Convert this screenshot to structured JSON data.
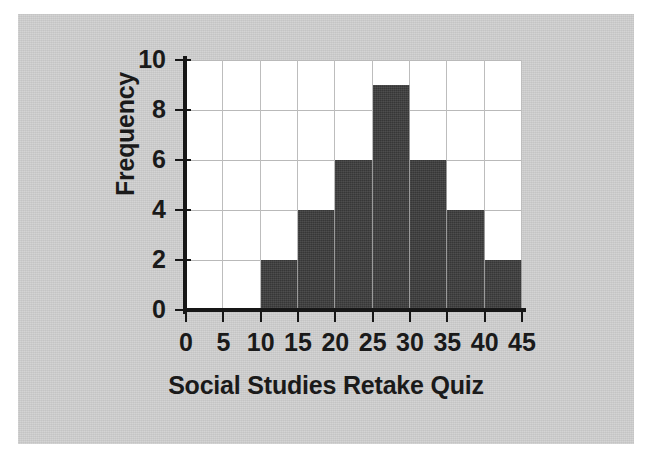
{
  "figure": {
    "background_color": "#cfcfcf",
    "plot_background_color": "#ffffff",
    "bar_color": "#3d3d3d",
    "grid_color": "#b9b9b9",
    "axis_color": "#171717"
  },
  "chart_data": {
    "type": "bar",
    "title": "",
    "xlabel": "Social Studies Retake Quiz",
    "ylabel": "Frequency",
    "categories": [
      "0-5",
      "5-10",
      "10-15",
      "15-20",
      "20-25",
      "25-30",
      "30-35",
      "35-40",
      "40-45"
    ],
    "bin_edges": [
      0,
      5,
      10,
      15,
      20,
      25,
      30,
      35,
      40,
      45
    ],
    "values": [
      0,
      0,
      2,
      4,
      6,
      9,
      6,
      4,
      2
    ],
    "xlim": [
      0,
      45
    ],
    "ylim": [
      0,
      10
    ],
    "xticks": [
      0,
      5,
      10,
      15,
      20,
      25,
      30,
      35,
      40,
      45
    ],
    "xtick_labels": [
      "0",
      "5",
      "10",
      "15",
      "20",
      "25",
      "30",
      "35",
      "40",
      "45"
    ],
    "yticks": [
      0,
      2,
      4,
      6,
      8,
      10
    ],
    "ytick_labels": [
      "0",
      "2",
      "4",
      "6",
      "8",
      "10"
    ],
    "grid": true,
    "legend": false
  }
}
